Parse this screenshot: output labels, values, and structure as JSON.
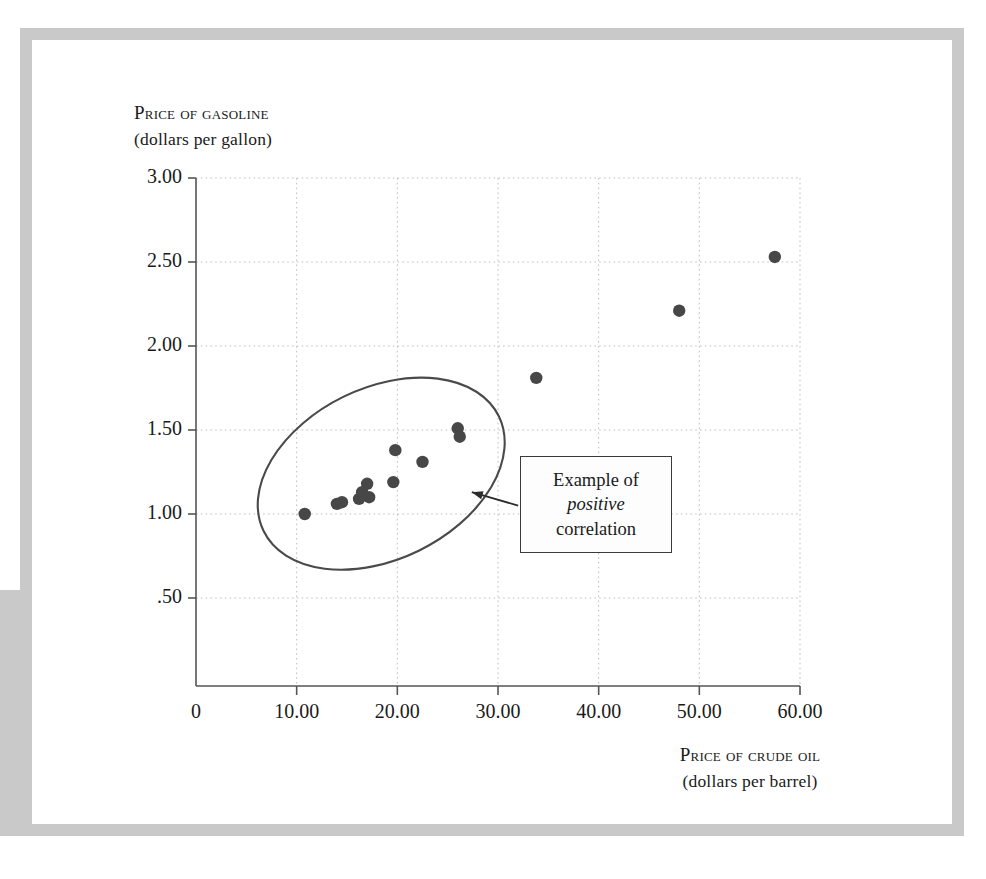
{
  "figure": {
    "background_color": "#ffffff",
    "frame_color": "#c9c9c9",
    "axis_color": "#555555",
    "grid_color": "#bdbdbd",
    "point_color": "#474747",
    "ellipse_color": "#4a4a4a",
    "annotation_border_color": "#3a3a3a"
  },
  "axes": {
    "y_title_line1": "Price of gasoline",
    "y_title_line2": "(dollars per gallon)",
    "x_title_line1": "Price of crude oil",
    "x_title_line2": "(dollars per barrel)"
  },
  "annotation": {
    "line1": "Example of",
    "line2": "positive",
    "line3": "correlation"
  },
  "chart_data": {
    "type": "scatter",
    "title": "",
    "xlabel": "Price of crude oil (dollars per barrel)",
    "ylabel": "Price of gasoline (dollars per gallon)",
    "xlim": [
      0,
      60
    ],
    "ylim": [
      0,
      3.0
    ],
    "xticks": [
      0,
      10,
      20,
      30,
      40,
      50,
      60
    ],
    "xtick_labels": [
      "0",
      "10.00",
      "20.00",
      "30.00",
      "40.00",
      "50.00",
      "60.00"
    ],
    "yticks": [
      0.5,
      1.0,
      1.5,
      2.0,
      2.5,
      3.0
    ],
    "ytick_labels": [
      ".50",
      "1.00",
      "1.50",
      "2.00",
      "2.50",
      "3.00"
    ],
    "grid": true,
    "grid_style": "dotted",
    "legend": null,
    "series": [
      {
        "name": "Gasoline vs crude oil price",
        "marker": "circle",
        "color": "#474747",
        "points": [
          {
            "x": 10.8,
            "y": 1.0
          },
          {
            "x": 14.0,
            "y": 1.06
          },
          {
            "x": 14.5,
            "y": 1.07
          },
          {
            "x": 16.2,
            "y": 1.09
          },
          {
            "x": 16.5,
            "y": 1.13
          },
          {
            "x": 17.0,
            "y": 1.18
          },
          {
            "x": 17.2,
            "y": 1.1
          },
          {
            "x": 19.6,
            "y": 1.19
          },
          {
            "x": 19.8,
            "y": 1.38
          },
          {
            "x": 22.5,
            "y": 1.31
          },
          {
            "x": 26.0,
            "y": 1.51
          },
          {
            "x": 26.2,
            "y": 1.46
          },
          {
            "x": 33.8,
            "y": 1.81
          },
          {
            "x": 48.0,
            "y": 2.21
          },
          {
            "x": 57.5,
            "y": 2.53
          }
        ]
      }
    ],
    "annotations": [
      {
        "type": "ellipse",
        "label": "positive correlation envelope",
        "center_x": 18.4,
        "center_y": 1.24,
        "width": 26.0,
        "height": 1.02,
        "rotation_deg": -26
      },
      {
        "type": "callout",
        "text": "Example of positive correlation",
        "emphasis_word": "positive",
        "arrow_from_x": 32.0,
        "arrow_from_y": 1.05,
        "arrow_to_x": 27.4,
        "arrow_to_y": 1.13
      }
    ]
  }
}
